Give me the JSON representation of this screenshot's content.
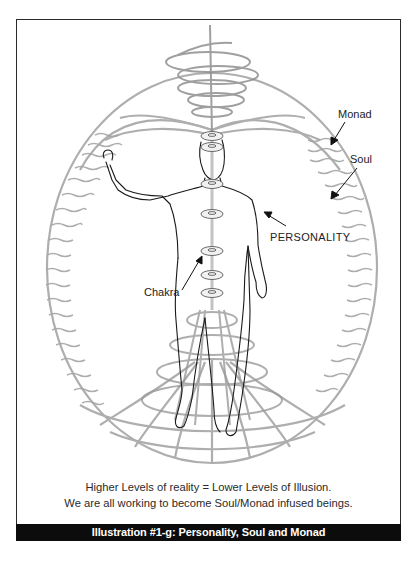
{
  "figure": {
    "labels": {
      "monad": "Monad",
      "soul": "Soul",
      "personality": "PERSONALITY",
      "chakra": "Chakra"
    },
    "caption": {
      "line1": "Higher Levels of reality = Lower Levels of Illusion.",
      "line2": "We are all working to become Soul/Monad infused beings."
    },
    "title": "Illustration #1-g: Personality, Soul and Monad",
    "colors": {
      "frame": "#2a2a2a",
      "title_bar": "#0c0c0c",
      "energy_lines": "#9a9a9a",
      "figure_outline": "#1a1a1a"
    },
    "chakra_count": 7
  }
}
